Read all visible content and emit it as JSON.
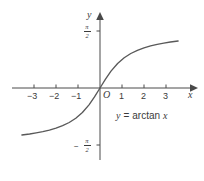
{
  "chart_data": {
    "type": "line",
    "title": "",
    "function_label": "y = arctan x",
    "xlabel": "x",
    "ylabel": "y",
    "xlim": [
      -3.55,
      3.55
    ],
    "ylim": [
      -1.9,
      1.9
    ],
    "grid": false,
    "legend": "none",
    "origin_label": "O",
    "x_ticks": [
      -3,
      -2,
      -1,
      1,
      2,
      3
    ],
    "x_tick_labels": [
      "−3",
      "−2",
      "−1",
      "1",
      "2",
      "3"
    ],
    "y_ticks": [
      1.5708,
      -1.5708
    ],
    "y_tick_labels": [
      "π/2",
      "−π/2"
    ],
    "y_tick_num": "π",
    "y_tick_den": "2",
    "asymptotes": [
      1.5708,
      -1.5708
    ],
    "series": [
      {
        "name": "arctan x",
        "color": "#595959",
        "x": [
          -3.55,
          -3.2,
          -2.9,
          -2.6,
          -2.3,
          -2.0,
          -1.7,
          -1.4,
          -1.1,
          -0.8,
          -0.5,
          -0.25,
          0,
          0.25,
          0.5,
          0.8,
          1.1,
          1.4,
          1.7,
          2.0,
          2.3,
          2.6,
          2.9,
          3.2,
          3.55
        ],
        "y": [
          -1.296,
          -1.268,
          -1.238,
          -1.204,
          -1.161,
          -1.107,
          -1.039,
          -0.951,
          -0.833,
          -0.675,
          -0.464,
          -0.245,
          0,
          0.245,
          0.464,
          0.675,
          0.833,
          0.951,
          1.039,
          1.107,
          1.161,
          1.204,
          1.238,
          1.268,
          1.296
        ]
      }
    ]
  },
  "axes": {
    "x_axis_name": "x-axis",
    "y_axis_name": "y-axis",
    "axis_color": "#4a4a4a"
  },
  "labels": {
    "y_axis_letter": "y",
    "x_axis_letter": "x",
    "origin": "O",
    "x_neg3": "−3",
    "x_neg2": "−2",
    "x_neg1": "−1",
    "x_pos1": "1",
    "x_pos2": "2",
    "x_pos3": "3",
    "pi": "π",
    "two": "2",
    "minus": "−",
    "equation_y": "y",
    "equation_eq": "=",
    "equation_fn": "arctan",
    "equation_x": "x"
  }
}
